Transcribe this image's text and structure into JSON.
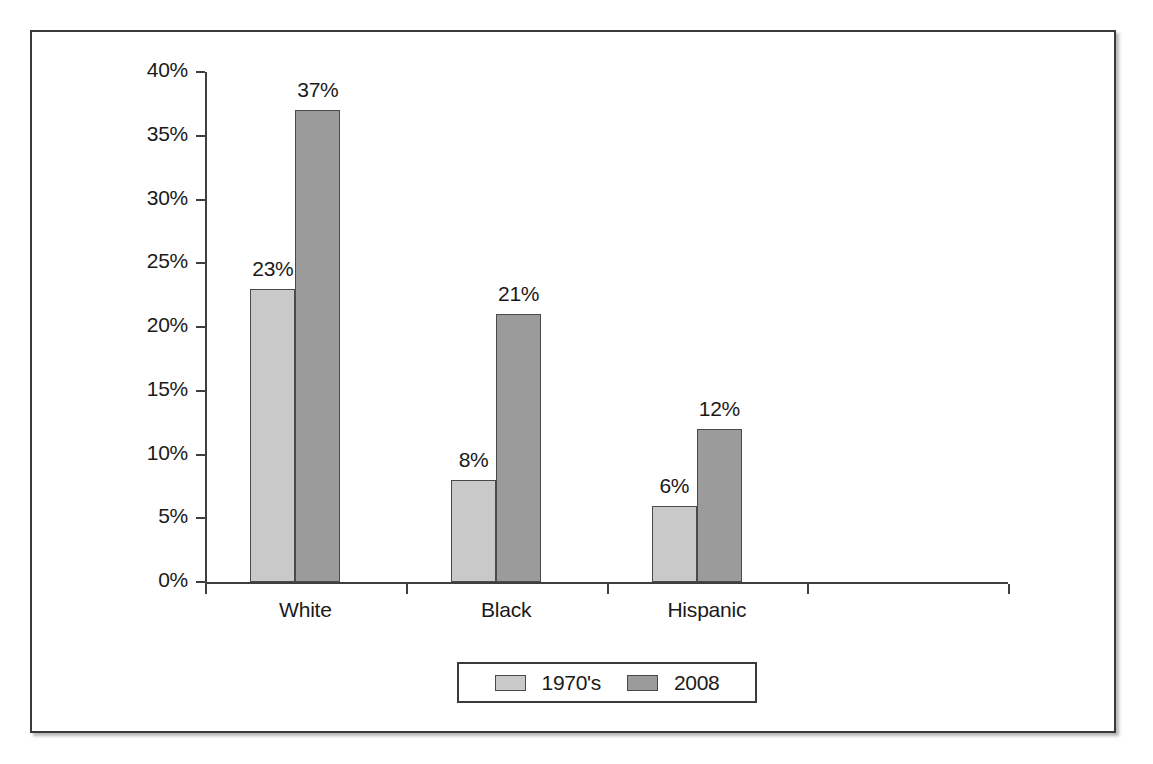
{
  "chart_data": {
    "type": "bar",
    "title": "",
    "subtitle": "",
    "xlabel": "",
    "ylabel": "",
    "categories": [
      "White",
      "Black",
      "Hispanic",
      ""
    ],
    "series": [
      {
        "name": "1970's",
        "values": [
          23,
          8,
          6,
          null
        ],
        "color": "#c9c9c9"
      },
      {
        "name": "2008",
        "values": [
          37,
          21,
          12,
          null
        ],
        "color": "#9b9b9b"
      }
    ],
    "data_labels": [
      [
        "23%",
        "37%"
      ],
      [
        "8%",
        "21%"
      ],
      [
        "6%",
        "12%"
      ],
      [
        "",
        ""
      ]
    ],
    "ylim": [
      0,
      40
    ],
    "ytick_values": [
      0,
      5,
      10,
      15,
      20,
      25,
      30,
      35,
      40
    ],
    "ytick_labels": [
      "0%",
      "5%",
      "10%",
      "15%",
      "20%",
      "25%",
      "30%",
      "35%",
      "40%"
    ],
    "grid": false,
    "legend_position": "bottom-center",
    "value_suffix": "%"
  },
  "legend": {
    "entries": [
      {
        "label": "1970's",
        "swatch": "light-gray-swatch"
      },
      {
        "label": "2008",
        "swatch": "dark-gray-swatch"
      }
    ]
  },
  "colors": {
    "series_1970s": "#c9c9c9",
    "series_2008": "#9b9b9b",
    "axis": "#3f3f3f",
    "frame": "#3a3a3a",
    "text": "#1a1a1a",
    "background": "#ffffff"
  }
}
